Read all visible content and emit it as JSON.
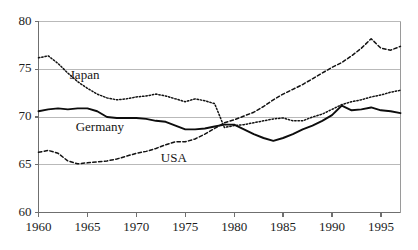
{
  "chart_data": {
    "type": "line",
    "title": "",
    "xlabel": "",
    "ylabel": "",
    "xlim": [
      1960,
      1997
    ],
    "ylim": [
      60,
      80
    ],
    "grid": true,
    "grid_axis": "y",
    "gridlines_y": [
      65,
      70,
      75,
      80
    ],
    "legend_position": "inline-annotations",
    "x_ticks": [
      1960,
      1965,
      1970,
      1975,
      1980,
      1985,
      1990,
      1995
    ],
    "x_tick_labels": [
      "1960",
      "1965",
      "1970",
      "1975",
      "1980",
      "1985",
      "1990",
      "1995"
    ],
    "y_ticks": [
      60,
      65,
      70,
      75,
      80
    ],
    "y_tick_labels": [
      "60",
      "65",
      "70",
      "75",
      "80"
    ],
    "x": [
      1960,
      1961,
      1962,
      1963,
      1964,
      1965,
      1966,
      1967,
      1968,
      1969,
      1970,
      1971,
      1972,
      1973,
      1974,
      1975,
      1976,
      1977,
      1978,
      1979,
      1980,
      1981,
      1982,
      1983,
      1984,
      1985,
      1986,
      1987,
      1988,
      1989,
      1990,
      1991,
      1992,
      1993,
      1994,
      1995,
      1996,
      1997
    ],
    "series": [
      {
        "name": "Japan",
        "style": "dotted",
        "color": "#111111",
        "values": [
          76.2,
          76.4,
          75.6,
          74.6,
          73.7,
          73.0,
          72.4,
          72.0,
          71.8,
          71.9,
          72.1,
          72.2,
          72.4,
          72.2,
          71.9,
          71.6,
          71.9,
          71.7,
          71.4,
          68.9,
          69.1,
          69.2,
          69.4,
          69.6,
          69.8,
          69.9,
          69.6,
          69.6,
          70.0,
          70.3,
          70.8,
          71.3,
          71.6,
          71.8,
          72.1,
          72.3,
          72.6,
          72.8
        ]
      },
      {
        "name": "Germany",
        "style": "solid",
        "color": "#0d0d0d",
        "values": [
          70.6,
          70.8,
          70.9,
          70.8,
          70.9,
          70.9,
          70.6,
          70.0,
          69.9,
          69.9,
          69.9,
          69.8,
          69.6,
          69.5,
          69.1,
          68.7,
          68.7,
          68.8,
          69.0,
          69.2,
          69.2,
          68.7,
          68.2,
          67.8,
          67.5,
          67.8,
          68.2,
          68.7,
          69.1,
          69.6,
          70.2,
          71.2,
          70.7,
          70.8,
          71.0,
          70.7,
          70.6,
          70.4
        ]
      },
      {
        "name": "USA",
        "style": "dashed",
        "color": "#121212",
        "values": [
          66.3,
          66.5,
          66.2,
          65.4,
          65.1,
          65.2,
          65.3,
          65.4,
          65.6,
          65.9,
          66.2,
          66.4,
          66.7,
          67.1,
          67.4,
          67.4,
          67.7,
          68.2,
          68.8,
          69.4,
          69.7,
          70.1,
          70.5,
          71.1,
          71.8,
          72.4,
          72.9,
          73.4,
          74.0,
          74.6,
          75.2,
          75.7,
          76.4,
          77.2,
          78.2,
          77.2,
          77.0,
          77.4
        ]
      }
    ],
    "annotations": [
      {
        "text": "Japan",
        "x": 1963.2,
        "y": 74.3
      },
      {
        "text": "Germany",
        "x": 1963.8,
        "y": 68.9
      },
      {
        "text": "USA",
        "x": 1972.5,
        "y": 65.6
      }
    ]
  }
}
